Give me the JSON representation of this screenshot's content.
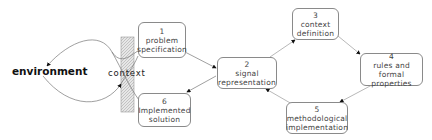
{
  "diagram": {
    "environment_label": "environment",
    "context_label": "context",
    "boxes": [
      {
        "num": "1",
        "line1": "problem",
        "line2": "specification"
      },
      {
        "num": "2",
        "line1": "signal",
        "line2": "representation"
      },
      {
        "num": "3",
        "line1": "context",
        "line2": "definition"
      },
      {
        "num": "4",
        "line1": "rules and formal",
        "line2": "properties"
      },
      {
        "num": "5",
        "line1": "methodological",
        "line2": "implementation"
      },
      {
        "num": "6",
        "line1": "Implemented",
        "line2": "solution"
      }
    ],
    "edges": [
      {
        "from": "1",
        "to": "2"
      },
      {
        "from": "2",
        "to": "3"
      },
      {
        "from": "3",
        "to": "4"
      },
      {
        "from": "4",
        "to": "5"
      },
      {
        "from": "5",
        "to": "2"
      },
      {
        "from": "2",
        "to": "6"
      },
      {
        "from": "6",
        "to": "environment"
      },
      {
        "from": "environment",
        "to": "1"
      }
    ],
    "colors": {
      "border": "#8a8a8a",
      "hatch": "#c8c8c8",
      "line": "#777777",
      "arrow": "#111111"
    }
  }
}
